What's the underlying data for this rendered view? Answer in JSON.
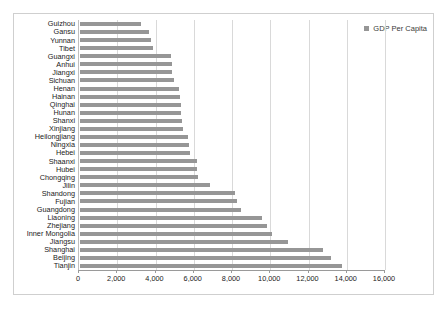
{
  "legend": {
    "position": "top-right",
    "entries": [
      {
        "label": "GDP Per Capita",
        "marker": "square-marker-icon",
        "color": "#969696"
      }
    ]
  },
  "axis": {
    "x_ticks": [
      "0",
      "2,000",
      "4,000",
      "6,000",
      "8,000",
      "10,000",
      "12,000",
      "14,000",
      "16,000"
    ]
  },
  "colors": {
    "bar": "#969696",
    "gridline": "#d9d9d9",
    "axis": "#9a9a9a",
    "frame": "#cfcfcf",
    "text": "#1a1a1a"
  },
  "chart_data": {
    "type": "bar",
    "orientation": "horizontal",
    "title": "",
    "xlabel": "",
    "ylabel": "",
    "xlim": [
      0,
      16000
    ],
    "xtick_step": 2000,
    "grid": true,
    "legend_position": "top-right",
    "series": [
      {
        "name": "GDP Per Capita",
        "color": "#969696",
        "values": [
          3200,
          3600,
          3700,
          3800,
          4750,
          4800,
          4800,
          4900,
          5200,
          5250,
          5300,
          5300,
          5350,
          5400,
          5650,
          5700,
          5750,
          6100,
          6100,
          6150,
          6800,
          8100,
          8200,
          8400,
          9500,
          9800,
          10050,
          10900,
          12700,
          13100,
          13700
        ]
      }
    ],
    "categories": [
      "Guizhou",
      "Gansu",
      "Yunnan",
      "Tibet",
      "Guangxi",
      "Anhui",
      "Jiangxi",
      "Sichuan",
      "Henan",
      "Hainan",
      "Qinghai",
      "Hunan",
      "Shanxi",
      "Xinjiang",
      "Heilongjiang",
      "Ningxia",
      "Hebei",
      "Shaanxi",
      "Hubei",
      "Chongqing",
      "Jilin",
      "Shandong",
      "Fujian",
      "Guangdong",
      "Liaoning",
      "Zhejiang",
      "Inner Mongolia",
      "Jiangsu",
      "Shanghai",
      "Beijing",
      "Tianjin"
    ]
  }
}
